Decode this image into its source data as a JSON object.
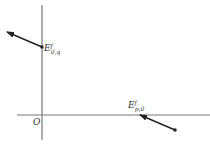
{
  "diagram": {
    "origin_label": "O",
    "vectors": [
      {
        "id": "E_0q",
        "label_main": "E",
        "label_sup": "f",
        "label_sub": "0,q",
        "start": [
          42,
          47
        ],
        "end": [
          7,
          32
        ],
        "start_marker": "square"
      },
      {
        "id": "E_p0",
        "label_main": "E",
        "label_sup": "f",
        "label_sub": "p,0",
        "start": [
          175,
          130
        ],
        "end": [
          140,
          115
        ],
        "start_marker": "dot"
      }
    ],
    "axes": {
      "x_axis": {
        "from": [
          17,
          115
        ],
        "to": [
          210,
          115
        ]
      },
      "y_axis": {
        "from": [
          42,
          5
        ],
        "to": [
          42,
          140
        ]
      }
    },
    "colors": {
      "axis": "#777777",
      "vector": "#222222",
      "text": "#333333"
    }
  }
}
